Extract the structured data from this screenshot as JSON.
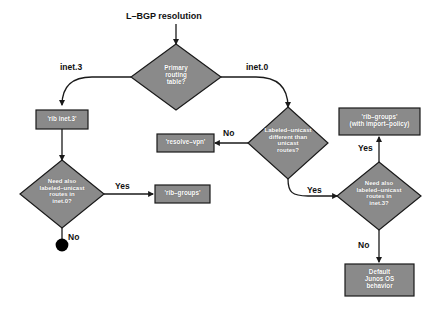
{
  "diagram": {
    "colors": {
      "background": "#ffffff",
      "shape_fill": "#8a8a8a",
      "shape_stroke": "#1a1a1a",
      "shape_text": "#ffffff",
      "edge_stroke": "#1a1a1a",
      "label_text": "#111111",
      "terminator_fill": "#000000"
    },
    "nodes": {
      "start": {
        "id": "start",
        "type": "label",
        "text": "L–BGP resolution"
      },
      "primary_routing_table": {
        "id": "primary_routing_table",
        "type": "decision",
        "text": "Primary\nrouting\ntable?"
      },
      "rib_inet3": {
        "id": "rib_inet3",
        "type": "process",
        "text": "'rib inet.3'"
      },
      "need_labeled_inet0": {
        "id": "need_labeled_inet0",
        "type": "decision",
        "text": "Need also\nlabeled–unicast\nroutes in\ninet.0?"
      },
      "rib_groups": {
        "id": "rib_groups",
        "type": "process",
        "text": "'rib–groups'"
      },
      "end_terminator": {
        "id": "end_terminator",
        "type": "terminator",
        "text": ""
      },
      "labeled_different": {
        "id": "labeled_different",
        "type": "decision",
        "text": "Labeled–unicast\ndifferent than\nunicast\nroutes?"
      },
      "resolve_vpn": {
        "id": "resolve_vpn",
        "type": "process",
        "text": "'resolve–vpn'"
      },
      "need_labeled_inet3": {
        "id": "need_labeled_inet3",
        "type": "decision",
        "text": "Need also\nlabeled–unicast\nroutes in\ninet.3?"
      },
      "rib_groups_import": {
        "id": "rib_groups_import",
        "type": "process",
        "text": "'rib–groups'\n(with import–policy)"
      },
      "default_junos": {
        "id": "default_junos",
        "type": "process",
        "text": "Default\nJunos OS\nbehavior"
      }
    },
    "edges": [
      {
        "id": "e-start",
        "from": "start",
        "to": "primary_routing_table",
        "label": ""
      },
      {
        "id": "e-inet3",
        "from": "primary_routing_table",
        "to": "rib_inet3",
        "label": "inet.3"
      },
      {
        "id": "e-inet0",
        "from": "primary_routing_table",
        "to": "labeled_different",
        "label": "inet.0"
      },
      {
        "id": "e-rib-to-need",
        "from": "rib_inet3",
        "to": "need_labeled_inet0",
        "label": ""
      },
      {
        "id": "e-need0-yes",
        "from": "need_labeled_inet0",
        "to": "rib_groups",
        "label": "Yes"
      },
      {
        "id": "e-need0-no",
        "from": "need_labeled_inet0",
        "to": "end_terminator",
        "label": "No"
      },
      {
        "id": "e-diff-no",
        "from": "labeled_different",
        "to": "resolve_vpn",
        "label": "No"
      },
      {
        "id": "e-diff-yes",
        "from": "labeled_different",
        "to": "need_labeled_inet3",
        "label": "Yes"
      },
      {
        "id": "e-need3-yes",
        "from": "need_labeled_inet3",
        "to": "rib_groups_import",
        "label": "Yes"
      },
      {
        "id": "e-need3-no",
        "from": "need_labeled_inet3",
        "to": "default_junos",
        "label": "No"
      }
    ]
  }
}
